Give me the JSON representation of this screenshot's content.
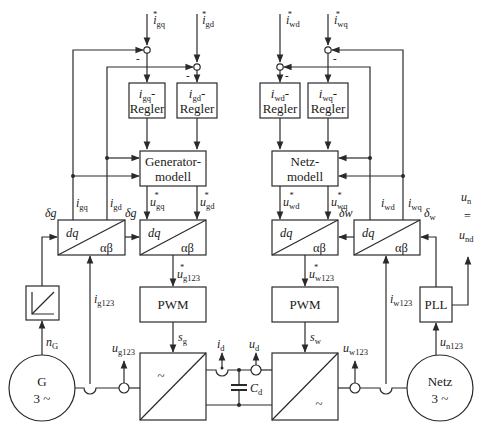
{
  "diagram": {
    "colors": {
      "line": "#2a2a2a",
      "background": "#ffffff",
      "text": "#1a1a1a"
    },
    "generator_side": {
      "ref_inputs": [
        {
          "symbol": "i",
          "sub": "gq",
          "star": "*"
        },
        {
          "symbol": "i",
          "sub": "gd",
          "star": "*"
        }
      ],
      "summing_minus": "-",
      "controllers": [
        {
          "line1_symbol": "i",
          "line1_sub": "gq",
          "line1_suffix": "-",
          "line2": "Regler"
        },
        {
          "line1_symbol": "i",
          "line1_sub": "gd",
          "line1_suffix": "-",
          "line2": "Regler"
        }
      ],
      "model": {
        "line1": "Generator-",
        "line2": "modell"
      },
      "feedback_labels": [
        {
          "symbol": "i",
          "sub": "gq"
        },
        {
          "symbol": "i",
          "sub": "gd"
        }
      ],
      "voltage_refs": [
        {
          "symbol": "u",
          "sub": "gq",
          "star": "*"
        },
        {
          "symbol": "u",
          "sub": "gd",
          "star": "*"
        }
      ],
      "transform_blocks": [
        {
          "top": "dq",
          "bottom": "αβ",
          "angle_in": "δg"
        },
        {
          "top": "dq",
          "bottom": "αβ",
          "angle_in": "δg"
        }
      ],
      "phase_current": {
        "symbol": "i",
        "sub": "g123"
      },
      "phase_voltage_ref": {
        "symbol": "u",
        "sub": "g123",
        "star": "*"
      },
      "pwm": "PWM",
      "switching": {
        "symbol": "s",
        "sub": "g"
      },
      "speed": {
        "symbol": "n",
        "sub": "G"
      },
      "terminal_voltage": {
        "symbol": "u",
        "sub": "g123"
      },
      "converter_symbol": "~",
      "machine": {
        "line1": "G",
        "line2": "3 ~"
      }
    },
    "dc_link": {
      "current": {
        "symbol": "i",
        "sub": "d"
      },
      "voltage": {
        "symbol": "u",
        "sub": "d"
      },
      "capacitor": {
        "symbol": "C",
        "sub": "d"
      }
    },
    "grid_side": {
      "ref_inputs": [
        {
          "symbol": "i",
          "sub": "wd",
          "star": "*"
        },
        {
          "symbol": "i",
          "sub": "wq",
          "star": "*"
        }
      ],
      "summing_minus": "-",
      "controllers": [
        {
          "line1_symbol": "i",
          "line1_sub": "wd",
          "line1_suffix": "-",
          "line2": "Regler"
        },
        {
          "line1_symbol": "i",
          "line1_sub": "wq",
          "line1_suffix": "-",
          "line2": "Regler"
        }
      ],
      "model": {
        "line1": "Netz-",
        "line2": "modell"
      },
      "feedback_labels": [
        {
          "symbol": "i",
          "sub": "wd"
        },
        {
          "symbol": "i",
          "sub": "wq"
        }
      ],
      "voltage_refs": [
        {
          "symbol": "u",
          "sub": "wd",
          "star": "*"
        },
        {
          "symbol": "u",
          "sub": "wq",
          "star": "*"
        }
      ],
      "transform_blocks": [
        {
          "top": "dq",
          "bottom": "αβ",
          "angle_in": "δw"
        },
        {
          "top": "dq",
          "bottom": "αβ",
          "angle_in": "δw"
        }
      ],
      "phase_current": {
        "symbol": "i",
        "sub": "w123"
      },
      "phase_voltage_ref": {
        "symbol": "u",
        "sub": "w123",
        "star": "*"
      },
      "pwm": "PWM",
      "switching": {
        "symbol": "s",
        "sub": "w"
      },
      "pll": "PLL",
      "grid_voltage": {
        "symbol": "u",
        "sub": "n123"
      },
      "terminal_voltage": {
        "symbol": "u",
        "sub": "w123"
      },
      "converter_symbol": "~",
      "grid": {
        "line1": "Netz",
        "line2": "3 ~"
      },
      "output": {
        "top_symbol": "u",
        "top_sub": "n",
        "equals": "=",
        "bottom_symbol": "u",
        "bottom_sub": "nd"
      }
    }
  }
}
